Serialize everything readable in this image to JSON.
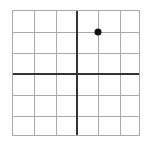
{
  "figure": {
    "title": "",
    "background_color": "#ffffff",
    "width": 146,
    "height": 145
  },
  "grid": {
    "border_color": "#a9a9a9",
    "minor_line_color": "#a9a9a9",
    "axis_line_color": "#333333",
    "cell_count_x": 6,
    "cell_count_y": 6,
    "plot_left": 12,
    "plot_top": 10,
    "plot_width": 128,
    "plot_height": 126
  },
  "chart_data": {
    "type": "scatter",
    "title": "",
    "xlabel": "",
    "ylabel": "",
    "xlim": [
      -3,
      3
    ],
    "ylim": [
      -3,
      3
    ],
    "xticks": [
      -3,
      -2,
      -1,
      0,
      1,
      2,
      3
    ],
    "yticks": [
      -3,
      -2,
      -1,
      0,
      1,
      2,
      3
    ],
    "xtick_labels": [
      "",
      "",
      "",
      "",
      "",
      "",
      ""
    ],
    "ytick_labels": [
      "",
      "",
      "",
      "",
      "",
      "",
      ""
    ],
    "grid": true,
    "legend": null,
    "axes_shown": [
      "x-axis",
      "y-axis"
    ],
    "origin": [
      0,
      0
    ],
    "series": [
      {
        "name": "point",
        "marker": "circle",
        "color": "#111111",
        "points": [
          {
            "x": 1,
            "y": 2
          }
        ]
      }
    ]
  },
  "points": [
    {
      "label": "plotted-point",
      "x": 1,
      "y": 2,
      "color": "#111111"
    }
  ]
}
